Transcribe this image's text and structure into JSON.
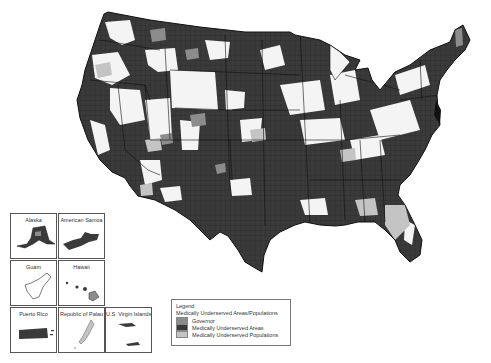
{
  "map": {
    "subject": "Medically Underserved Areas/Populations, United States (county-level choropleth)",
    "colors": {
      "land_unshaded": "#f4f4f4",
      "governor": "#8c8c8c",
      "mua": "#3a3a3a",
      "mup": "#c4c4c4",
      "border": "#111111"
    }
  },
  "insets": [
    {
      "name": "alaska",
      "title": "Alaska"
    },
    {
      "name": "american-samoa",
      "title": "American Samoa"
    },
    {
      "name": "guam",
      "title": "Guam"
    },
    {
      "name": "hawaii",
      "title": "Hawaii"
    },
    {
      "name": "puerto-rico",
      "title": "Puerto Rico"
    },
    {
      "name": "palau",
      "title": "Republic of Palau"
    },
    {
      "name": "virgin-islands",
      "title": "U.S. Virgin Islands"
    }
  ],
  "legend": {
    "heading": "Legend",
    "subheading": "Medically Underserved Areas/Populations",
    "items": [
      {
        "label": "Governor",
        "color": "#8c8c8c"
      },
      {
        "label": "Medically Underserved Areas",
        "color": "#3a3a3a"
      },
      {
        "label": "Medically Underserved Populations",
        "color": "#c4c4c4"
      }
    ]
  }
}
